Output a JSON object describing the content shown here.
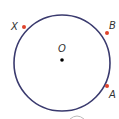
{
  "diagram": {
    "type": "circle-with-points",
    "circle": {
      "cx": 62,
      "cy": 63,
      "r": 48,
      "stroke": "#3a3a6e"
    },
    "center": {
      "label": "O",
      "x": 62,
      "y": 60
    },
    "points": [
      {
        "label": "X",
        "x": 24,
        "y": 27,
        "color": "#e0442c"
      },
      {
        "label": "B",
        "x": 107,
        "y": 33,
        "color": "#e0442c"
      },
      {
        "label": "A",
        "x": 107,
        "y": 86,
        "color": "#e0442c"
      }
    ]
  }
}
